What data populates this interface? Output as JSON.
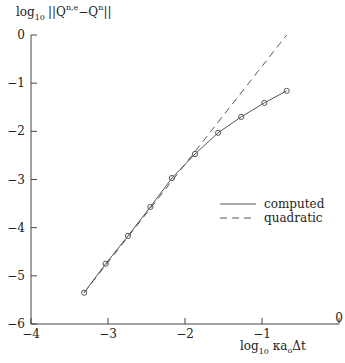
{
  "chart_data": {
    "type": "line",
    "title": "",
    "ylabel": "log10 ||Q_i^{n,e} - Q_i^n||",
    "xlabel": "log10 κ a_o Δt",
    "xlim": [
      -4,
      0
    ],
    "ylim": [
      -6,
      0
    ],
    "xticks": [
      -4,
      -3,
      -2,
      -1,
      0
    ],
    "yticks": [
      0,
      -1,
      -2,
      -3,
      -4,
      -5,
      -6
    ],
    "grid": false,
    "legend_position": "right-middle",
    "series": [
      {
        "name": "computed",
        "style": "solid",
        "markers": "circle",
        "x": [
          -3.31,
          -3.03,
          -2.74,
          -2.45,
          -2.17,
          -1.87,
          -1.57,
          -1.27,
          -0.97,
          -0.68
        ],
        "y": [
          -5.35,
          -4.75,
          -4.17,
          -3.57,
          -2.97,
          -2.47,
          -2.03,
          -1.7,
          -1.41,
          -1.16
        ]
      },
      {
        "name": "quadratic",
        "style": "dashed",
        "markers": "none",
        "x": [
          -3.31,
          -0.68
        ],
        "y": [
          -5.35,
          0.0
        ]
      }
    ]
  },
  "labels": {
    "ylabel_log": "log",
    "ylabel_sub": "10",
    "ylabel_norm": "||Q",
    "ylabel_sup1": "n,e",
    "ylabel_sub1": "i",
    "ylabel_minus": "−Q",
    "ylabel_sup2": "n",
    "ylabel_sub2": "i",
    "ylabel_end": "||",
    "xlabel_log": "log",
    "xlabel_sub": "10",
    "xlabel_rest": " κa",
    "xlabel_sub_o": "o",
    "xlabel_dt": "Δt",
    "tick_fmt": [
      "−4",
      "−3",
      "−2",
      "−1",
      "0"
    ],
    "ytick_fmt": [
      "0",
      "−1",
      "−2",
      "−3",
      "−4",
      "−5",
      "−6"
    ]
  },
  "colors": {
    "line": "#555555",
    "axis": "#444444",
    "text": "#222222"
  }
}
